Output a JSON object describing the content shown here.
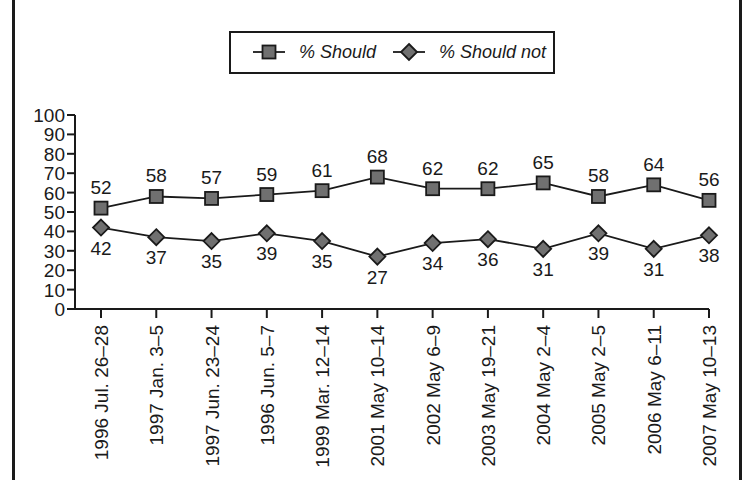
{
  "colors": {
    "line": "#1a1a1a",
    "marker_fill": "#707070",
    "frame": "#1a1a1a",
    "background": "#ffffff"
  },
  "legend": {
    "items": [
      {
        "label": "% Should",
        "marker": "square"
      },
      {
        "label": "% Should not",
        "marker": "diamond"
      }
    ]
  },
  "chart_data": {
    "type": "line",
    "title": "",
    "xlabel": "",
    "ylabel": "",
    "ylim": [
      0,
      100
    ],
    "yticks": [
      0,
      10,
      20,
      30,
      40,
      50,
      60,
      70,
      80,
      90,
      100
    ],
    "grid": false,
    "legend_position": "top-center",
    "categories": [
      "1996 Jul. 26–28",
      "1997 Jan. 3–5",
      "1997 Jun. 23–24",
      "1996 Jun. 5–7",
      "1999 Mar. 12–14",
      "2001 May 10–14",
      "2002 May 6–9",
      "2003 May 19–21",
      "2004 May 2–4",
      "2005 May 2–5",
      "2006 May 6–11",
      "2007 May 10–13"
    ],
    "series": [
      {
        "name": "% Should",
        "marker": "square",
        "values": [
          52,
          58,
          57,
          59,
          61,
          68,
          62,
          62,
          65,
          58,
          64,
          56
        ]
      },
      {
        "name": "% Should not",
        "marker": "diamond",
        "values": [
          42,
          37,
          35,
          39,
          35,
          27,
          34,
          36,
          31,
          39,
          31,
          38
        ]
      }
    ]
  }
}
